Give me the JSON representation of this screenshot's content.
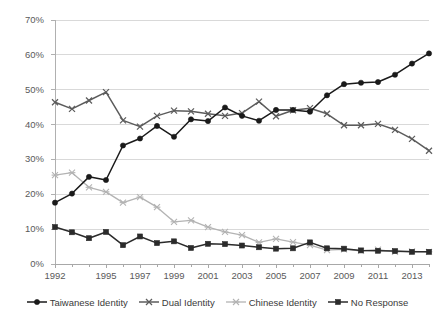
{
  "chart_data": {
    "type": "line",
    "title": "",
    "xlabel": "",
    "ylabel": "",
    "xlim": [
      1992,
      2014
    ],
    "ylim": [
      0,
      70
    ],
    "ytick_labels": [
      "0%",
      "10%",
      "20%",
      "30%",
      "40%",
      "50%",
      "60%",
      "70%"
    ],
    "ytick_values": [
      0,
      10,
      20,
      30,
      40,
      50,
      60,
      70
    ],
    "xtick_labels": [
      "1992",
      "1995",
      "1997",
      "1999",
      "2001",
      "2003",
      "2005",
      "2007",
      "2009",
      "2011",
      "2013"
    ],
    "xtick_values": [
      1992,
      1995,
      1997,
      1999,
      2001,
      2003,
      2005,
      2007,
      2009,
      2011,
      2013
    ],
    "x": [
      1992,
      1993,
      1994,
      1995,
      1996,
      1997,
      1998,
      1999,
      2000,
      2001,
      2002,
      2003,
      2004,
      2005,
      2006,
      2007,
      2008,
      2009,
      2010,
      2011,
      2012,
      2013,
      2014
    ],
    "grid": "horizontal",
    "legend_position": "bottom",
    "series": [
      {
        "name": "Taiwanese Identity",
        "color": "#1a1a1a",
        "marker": "diamond",
        "values": [
          17.6,
          20.2,
          25.0,
          24.1,
          34.0,
          36.0,
          39.6,
          36.5,
          41.5,
          41.0,
          44.9,
          42.5,
          41.1,
          44.2,
          44.2,
          43.7,
          48.4,
          51.6,
          52.0,
          52.2,
          54.3,
          57.5,
          60.4
        ]
      },
      {
        "name": "Dual Identity",
        "color": "#5c5c5c",
        "marker": "x",
        "values": [
          46.4,
          44.5,
          46.9,
          49.3,
          41.2,
          39.4,
          42.5,
          44.0,
          43.8,
          43.1,
          42.5,
          43.3,
          46.6,
          42.4,
          44.1,
          44.7,
          43.1,
          39.8,
          39.8,
          40.2,
          38.5,
          35.9,
          32.5
        ]
      },
      {
        "name": "Chinese Identity",
        "color": "#b3b3b3",
        "marker": "star",
        "values": [
          25.5,
          26.2,
          22.0,
          20.7,
          17.6,
          19.2,
          16.3,
          12.1,
          12.5,
          10.6,
          9.2,
          8.3,
          6.2,
          7.2,
          6.3,
          5.4,
          4.0,
          4.2,
          3.8,
          4.1,
          3.5,
          3.6,
          3.5
        ]
      },
      {
        "name": "No Response",
        "color": "#2b2b2b",
        "marker": "square",
        "values": [
          10.6,
          9.1,
          7.4,
          9.2,
          5.4,
          7.9,
          6.0,
          6.5,
          4.6,
          5.8,
          5.7,
          5.3,
          4.8,
          4.4,
          4.5,
          6.2,
          4.5,
          4.4,
          3.9,
          3.8,
          3.7,
          3.5,
          3.5
        ]
      }
    ]
  },
  "legend": {
    "items": [
      {
        "label": "Taiwanese Identity",
        "marker": "diamond-marker-icon",
        "color": "#1a1a1a"
      },
      {
        "label": "Dual Identity",
        "marker": "x-marker-icon",
        "color": "#5c5c5c"
      },
      {
        "label": "Chinese Identity",
        "marker": "star-marker-icon",
        "color": "#b3b3b3"
      },
      {
        "label": "No Response",
        "marker": "square-marker-icon",
        "color": "#2b2b2b"
      }
    ]
  }
}
